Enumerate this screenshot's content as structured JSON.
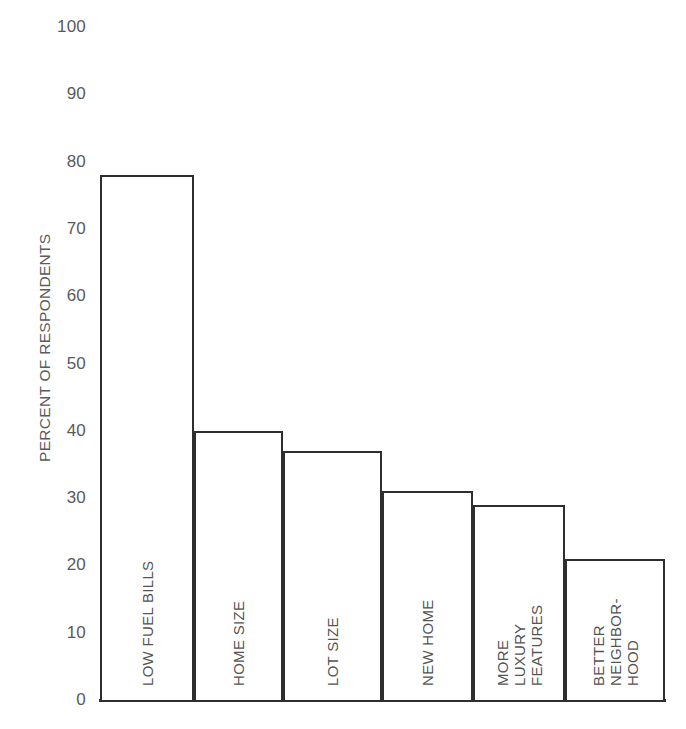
{
  "chart_data": {
    "type": "bar",
    "title": "",
    "subtitle": "",
    "xlabel": "",
    "ylabel": "PERCENT OF RESPONDENTS",
    "ylim": [
      0,
      100
    ],
    "ytick_step": 10,
    "yticks": [
      "100",
      "90",
      "80",
      "70",
      "60",
      "50",
      "40",
      "30",
      "20",
      "10",
      "0"
    ],
    "grid": false,
    "legend": null,
    "categories": [
      "LOW FUEL BILLS",
      "HOME SIZE",
      "LOT SIZE",
      "NEW HOME",
      "MORE LUXURY FEATURES",
      "BETTER NEIGHBORHOOD"
    ],
    "values": [
      78,
      40,
      37,
      31,
      29,
      21
    ],
    "bar_face_color": "#ffffff",
    "bar_edge_color": "#2e2e2e",
    "text_color": "#545454",
    "background_color": "#ffffff"
  },
  "axis": {
    "title": "PERCENT OF RESPONDENTS",
    "ticks": [
      {
        "label": "100",
        "value": 100
      },
      {
        "label": "90",
        "value": 90
      },
      {
        "label": "80",
        "value": 80
      },
      {
        "label": "70",
        "value": 70
      },
      {
        "label": "60",
        "value": 60
      },
      {
        "label": "50",
        "value": 50
      },
      {
        "label": "40",
        "value": 40
      },
      {
        "label": "30",
        "value": 30
      },
      {
        "label": "20",
        "value": 20
      },
      {
        "label": "10",
        "value": 10
      },
      {
        "label": "0",
        "value": 0
      }
    ]
  },
  "bars": [
    {
      "id": "low-fuel-bills",
      "value": 78,
      "label_lines": [
        "LOW FUEL BILLS"
      ],
      "x": 100,
      "width": 94
    },
    {
      "id": "home-size",
      "value": 40,
      "label_lines": [
        "HOME SIZE"
      ],
      "x": 194,
      "width": 89
    },
    {
      "id": "lot-size",
      "value": 37,
      "label_lines": [
        "LOT SIZE"
      ],
      "x": 283,
      "width": 99
    },
    {
      "id": "new-home",
      "value": 31,
      "label_lines": [
        "NEW HOME"
      ],
      "x": 382,
      "width": 91
    },
    {
      "id": "more-luxury-features",
      "value": 29,
      "label_lines": [
        "MORE",
        "LUXURY",
        "FEATURES"
      ],
      "x": 473,
      "width": 92
    },
    {
      "id": "better-neighborhood",
      "value": 21,
      "label_lines": [
        "BETTER",
        "NEIGHBOR-",
        "HOOD"
      ],
      "x": 565,
      "width": 100
    }
  ]
}
